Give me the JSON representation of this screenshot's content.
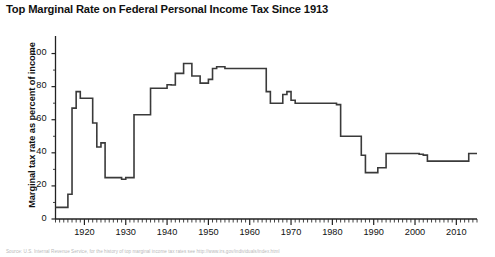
{
  "title": "Top Marginal Rate on Federal Personal Income Tax Since 1913",
  "caption": "Source: U.S. Internal Revenue Service, for the history of top marginal income tax rates see http://www.irs.gov/individuals/index.html",
  "axes": {
    "ylabel": "Marginal tax rate as percent of income",
    "xlabel": "",
    "yticks": [
      0,
      20,
      40,
      60,
      80,
      100
    ],
    "ytick_labels": [
      "0",
      "20",
      "40",
      "60",
      "80",
      "100"
    ],
    "xticks": [
      1920,
      1930,
      1940,
      1950,
      1960,
      1970,
      1980,
      1990,
      2000,
      2010
    ],
    "xtick_labels": [
      "1920",
      "1930",
      "1940",
      "1950",
      "1960",
      "1970",
      "1980",
      "1990",
      "2000",
      "2010"
    ],
    "xlim": [
      1913,
      2015
    ],
    "ylim": [
      0,
      110
    ],
    "minor_tick_interval": 1,
    "grid": false
  },
  "style": {
    "line_color": "#3a3a3a",
    "axis_color": "#222222",
    "background": "#ffffff",
    "line_width": 1.6
  },
  "chart_data": {
    "type": "line",
    "title": "Top Marginal Rate on Federal Personal Income Tax Since 1913",
    "xlabel": "",
    "ylabel": "Marginal tax rate as percent of income",
    "xlim": [
      1913,
      2015
    ],
    "ylim": [
      0,
      110
    ],
    "grid": false,
    "legend": null,
    "series": [
      {
        "name": "Top marginal federal personal income tax rate",
        "x": [
          1913,
          1914,
          1915,
          1916,
          1917,
          1918,
          1919,
          1920,
          1921,
          1922,
          1923,
          1924,
          1925,
          1926,
          1927,
          1928,
          1929,
          1930,
          1931,
          1932,
          1933,
          1934,
          1935,
          1936,
          1937,
          1938,
          1939,
          1940,
          1941,
          1942,
          1943,
          1944,
          1945,
          1946,
          1947,
          1948,
          1949,
          1950,
          1951,
          1952,
          1953,
          1954,
          1955,
          1956,
          1957,
          1958,
          1959,
          1960,
          1961,
          1962,
          1963,
          1964,
          1965,
          1966,
          1967,
          1968,
          1969,
          1970,
          1971,
          1972,
          1973,
          1974,
          1975,
          1976,
          1977,
          1978,
          1979,
          1980,
          1981,
          1982,
          1983,
          1984,
          1985,
          1986,
          1987,
          1988,
          1989,
          1990,
          1991,
          1992,
          1993,
          1994,
          1995,
          1996,
          1997,
          1998,
          1999,
          2000,
          2001,
          2002,
          2003,
          2004,
          2005,
          2006,
          2007,
          2008,
          2009,
          2010,
          2011,
          2012,
          2013,
          2014,
          2015
        ],
        "y": [
          7,
          7,
          7,
          15,
          67,
          77,
          73,
          73,
          73,
          58,
          43.5,
          46,
          25,
          25,
          25,
          25,
          24,
          25,
          25,
          63,
          63,
          63,
          63,
          79,
          79,
          79,
          79,
          81.1,
          81,
          88,
          88,
          94,
          94,
          86.45,
          86.45,
          82.13,
          82.13,
          84.36,
          91,
          92,
          92,
          91,
          91,
          91,
          91,
          91,
          91,
          91,
          91,
          91,
          91,
          77,
          70,
          70,
          70,
          75.25,
          77,
          71.75,
          70,
          70,
          70,
          70,
          70,
          70,
          70,
          70,
          70,
          70,
          69.125,
          50,
          50,
          50,
          50,
          50,
          38.5,
          28,
          28,
          28,
          31,
          31,
          39.6,
          39.6,
          39.6,
          39.6,
          39.6,
          39.6,
          39.6,
          39.6,
          39.1,
          38.6,
          35,
          35,
          35,
          35,
          35,
          35,
          35,
          35,
          35,
          35,
          39.6,
          39.6,
          39.6
        ]
      }
    ]
  }
}
